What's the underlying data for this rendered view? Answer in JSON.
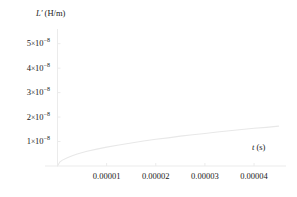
{
  "chart_data": {
    "type": "line",
    "title": "",
    "xlabel_var": "t",
    "xlabel_unit": "(s)",
    "ylabel_var": "L′",
    "ylabel_unit": "(H/m)",
    "xlim": [
      0,
      4.65e-05
    ],
    "ylim": [
      0,
      5.6e-08
    ],
    "grid": false,
    "legend": null,
    "x_ticks": [
      {
        "value": 1e-05,
        "label": "0.00001"
      },
      {
        "value": 2e-05,
        "label": "0.00002"
      },
      {
        "value": 3e-05,
        "label": "0.00003"
      },
      {
        "value": 4e-05,
        "label": "0.00004"
      }
    ],
    "y_ticks": [
      {
        "value": 1e-08,
        "mantissa": "1",
        "times": "×",
        "base": "10",
        "exponent": "−8"
      },
      {
        "value": 2e-08,
        "mantissa": "2",
        "times": "×",
        "base": "10",
        "exponent": "−8"
      },
      {
        "value": 3e-08,
        "mantissa": "3",
        "times": "×",
        "base": "10",
        "exponent": "−8"
      },
      {
        "value": 4e-08,
        "mantissa": "4",
        "times": "×",
        "base": "10",
        "exponent": "−8"
      },
      {
        "value": 5e-08,
        "mantissa": "5",
        "times": "×",
        "base": "10",
        "exponent": "−8"
      }
    ],
    "series": [
      {
        "name": "L' (t)",
        "color": "#e8e8e8",
        "x": [
          0.0,
          5e-07,
          1e-06,
          2e-06,
          3e-06,
          4e-06,
          6e-06,
          8e-06,
          1e-05,
          1.25e-05,
          1.5e-05,
          1.75e-05,
          2e-05,
          2.25e-05,
          2.5e-05,
          2.75e-05,
          3e-05,
          3.25e-05,
          3.5e-05,
          3.75e-05,
          4e-05,
          4.25e-05,
          4.5e-05
        ],
        "y": [
          0.0,
          1.7e-09,
          2.4e-09,
          3.4e-09,
          4.2e-09,
          4.9e-09,
          6e-09,
          6.9e-09,
          7.7e-09,
          8.6e-09,
          9.4e-09,
          1.02e-08,
          1.09e-08,
          1.15e-08,
          1.22e-08,
          1.28e-08,
          1.33e-08,
          1.39e-08,
          1.44e-08,
          1.49e-08,
          1.54e-08,
          1.58e-08,
          1.63e-08
        ]
      }
    ]
  },
  "style": {
    "axis_color": "#ebebeb",
    "curve_color": "#ececec",
    "text_color": "#1a1a1a",
    "background": "#ffffff"
  }
}
